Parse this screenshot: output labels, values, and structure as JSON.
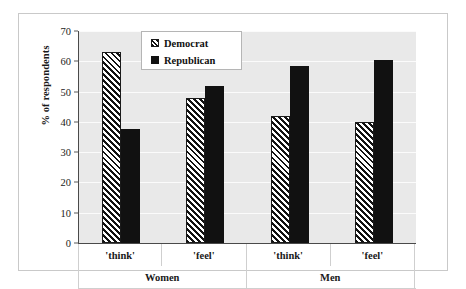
{
  "chart_data": {
    "type": "bar",
    "title": "",
    "subtitle": "",
    "xlabel": "",
    "ylabel": "% of respondents",
    "ylim": [
      0,
      70
    ],
    "yticks": [
      0,
      10,
      20,
      30,
      40,
      50,
      60,
      70
    ],
    "ytick_labels": [
      "0",
      "10",
      "20",
      "30",
      "40",
      "50",
      "60",
      "70"
    ],
    "grid": true,
    "legend_position": "top-left-inside",
    "categories": [
      "'think'",
      "'feel'",
      "'think'",
      "'feel'"
    ],
    "group_labels": [
      "Women",
      "Men"
    ],
    "groups": [
      {
        "label": "Women",
        "categories": [
          "'think'",
          "'feel'"
        ]
      },
      {
        "label": "Men",
        "categories": [
          "'think'",
          "'feel'"
        ]
      }
    ],
    "series": [
      {
        "name": "Democrat",
        "pattern": "diagonal-hatch",
        "color": "#ffffff",
        "values": [
          63,
          48,
          42,
          40
        ]
      },
      {
        "name": "Republican",
        "pattern": "solid",
        "color": "#111111",
        "values": [
          37.5,
          52,
          58.5,
          60.5
        ]
      }
    ],
    "bars": [
      {
        "group": "Women",
        "category": "'think'",
        "series": "Democrat",
        "value": 63
      },
      {
        "group": "Women",
        "category": "'think'",
        "series": "Republican",
        "value": 37.5
      },
      {
        "group": "Women",
        "category": "'feel'",
        "series": "Democrat",
        "value": 48
      },
      {
        "group": "Women",
        "category": "'feel'",
        "series": "Republican",
        "value": 52
      },
      {
        "group": "Men",
        "category": "'think'",
        "series": "Democrat",
        "value": 42
      },
      {
        "group": "Men",
        "category": "'think'",
        "series": "Republican",
        "value": 58.5
      },
      {
        "group": "Men",
        "category": "'feel'",
        "series": "Democrat",
        "value": 40
      },
      {
        "group": "Men",
        "category": "'feel'",
        "series": "Republican",
        "value": 60.5
      }
    ]
  },
  "legend": {
    "items": [
      {
        "label": "Democrat"
      },
      {
        "label": "Republican"
      }
    ]
  },
  "axis": {
    "y_title": "% of respondents"
  },
  "colors": {
    "plot_background": "#e9e9e9",
    "gridline": "#fbfbfb",
    "axis_line": "#4a4a4a",
    "bar_solid": "#111111",
    "bar_hatch_line": "#111111",
    "bar_hatch_background": "#ffffff",
    "text": "#1a1a1a",
    "frame": "#c9c9c9"
  }
}
